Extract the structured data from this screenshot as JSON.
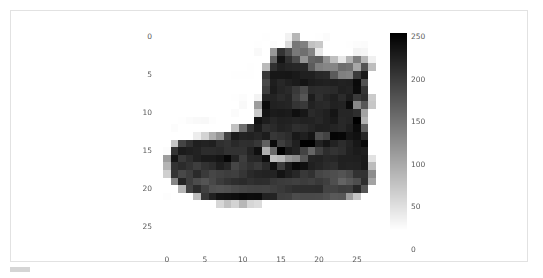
{
  "figure": {
    "background_color": "#ffffff",
    "border_color": "#e2e2e2",
    "corner_tab_color": "#d5d5d5"
  },
  "chart_data": {
    "type": "heatmap",
    "title": "",
    "xlabel": "",
    "ylabel": "",
    "colormap": "gray_r",
    "grid": false,
    "origin": "upper",
    "xlim": [
      -0.5,
      27.5
    ],
    "ylim": [
      27.5,
      -0.5
    ],
    "x_ticks": [
      "0",
      "5",
      "10",
      "15",
      "20",
      "25"
    ],
    "x_tick_values": [
      0,
      5,
      10,
      15,
      20,
      25
    ],
    "y_ticks": [
      "0",
      "5",
      "10",
      "15",
      "20",
      "25"
    ],
    "y_tick_values": [
      0,
      5,
      10,
      15,
      20,
      25
    ],
    "shape": [
      28,
      28
    ],
    "vmin": 0,
    "vmax": 255,
    "colorbar": {
      "orientation": "vertical",
      "position": "right",
      "ticks": [
        "250",
        "200",
        "150",
        "100",
        "50",
        "0"
      ],
      "tick_values": [
        250,
        200,
        150,
        100,
        50,
        0
      ],
      "range": [
        0,
        255
      ],
      "top_color": "#000000",
      "bottom_color": "#ffffff"
    },
    "values": [
      [
        0,
        0,
        0,
        0,
        0,
        0,
        0,
        0,
        0,
        0,
        0,
        0,
        0,
        1,
        0,
        0,
        13,
        73,
        0,
        0,
        1,
        4,
        0,
        0,
        0,
        0,
        0,
        0
      ],
      [
        0,
        0,
        0,
        0,
        0,
        0,
        0,
        0,
        0,
        0,
        0,
        0,
        1,
        0,
        3,
        0,
        36,
        136,
        127,
        62,
        54,
        0,
        0,
        0,
        1,
        3,
        4,
        0
      ],
      [
        0,
        0,
        0,
        0,
        0,
        0,
        0,
        0,
        0,
        0,
        0,
        0,
        6,
        0,
        102,
        204,
        176,
        134,
        144,
        123,
        23,
        0,
        0,
        0,
        0,
        12,
        10,
        0
      ],
      [
        0,
        0,
        0,
        0,
        0,
        0,
        0,
        0,
        0,
        0,
        0,
        0,
        0,
        0,
        155,
        236,
        207,
        178,
        107,
        156,
        161,
        109,
        64,
        23,
        77,
        130,
        72,
        15
      ],
      [
        0,
        0,
        0,
        0,
        0,
        0,
        0,
        0,
        0,
        0,
        0,
        1,
        0,
        69,
        207,
        223,
        218,
        216,
        216,
        163,
        127,
        121,
        122,
        146,
        141,
        88,
        172,
        66
      ],
      [
        0,
        0,
        0,
        0,
        0,
        0,
        0,
        0,
        0,
        1,
        1,
        1,
        0,
        200,
        232,
        232,
        233,
        229,
        223,
        223,
        215,
        213,
        164,
        127,
        123,
        196,
        229,
        0
      ],
      [
        0,
        0,
        0,
        0,
        0,
        0,
        0,
        0,
        0,
        0,
        0,
        0,
        0,
        183,
        225,
        216,
        223,
        228,
        235,
        227,
        224,
        222,
        224,
        221,
        223,
        245,
        173,
        0
      ],
      [
        0,
        0,
        0,
        0,
        0,
        0,
        0,
        0,
        0,
        0,
        0,
        0,
        0,
        193,
        228,
        218,
        213,
        198,
        180,
        212,
        210,
        211,
        213,
        223,
        220,
        243,
        202,
        0
      ],
      [
        0,
        0,
        0,
        0,
        0,
        0,
        0,
        0,
        0,
        1,
        3,
        0,
        12,
        219,
        220,
        212,
        218,
        192,
        169,
        227,
        208,
        218,
        224,
        212,
        226,
        197,
        209,
        52
      ],
      [
        0,
        0,
        0,
        0,
        0,
        0,
        0,
        0,
        0,
        0,
        6,
        0,
        99,
        244,
        222,
        220,
        218,
        203,
        198,
        221,
        215,
        213,
        222,
        220,
        245,
        119,
        167,
        56
      ],
      [
        0,
        0,
        0,
        0,
        0,
        0,
        0,
        0,
        0,
        4,
        0,
        0,
        55,
        236,
        228,
        230,
        228,
        240,
        232,
        213,
        218,
        223,
        234,
        217,
        217,
        209,
        92,
        0
      ],
      [
        0,
        0,
        1,
        4,
        6,
        7,
        2,
        0,
        0,
        0,
        0,
        0,
        237,
        226,
        217,
        223,
        222,
        219,
        222,
        221,
        216,
        223,
        229,
        215,
        218,
        255,
        77,
        0
      ],
      [
        0,
        3,
        0,
        0,
        0,
        0,
        0,
        0,
        0,
        62,
        145,
        204,
        228,
        207,
        213,
        221,
        218,
        208,
        211,
        218,
        224,
        223,
        219,
        215,
        224,
        244,
        159,
        0
      ],
      [
        0,
        0,
        0,
        0,
        18,
        44,
        82,
        107,
        189,
        228,
        220,
        222,
        217,
        226,
        200,
        205,
        211,
        230,
        224,
        234,
        176,
        188,
        250,
        248,
        233,
        238,
        215,
        0
      ],
      [
        0,
        57,
        187,
        208,
        224,
        221,
        224,
        208,
        204,
        214,
        208,
        209,
        200,
        159,
        245,
        193,
        206,
        223,
        255,
        255,
        221,
        234,
        221,
        211,
        220,
        232,
        246,
        0
      ],
      [
        3,
        202,
        228,
        224,
        221,
        211,
        211,
        214,
        205,
        205,
        205,
        220,
        240,
        80,
        150,
        255,
        229,
        221,
        188,
        154,
        191,
        210,
        204,
        209,
        222,
        228,
        225,
        0
      ],
      [
        98,
        233,
        198,
        210,
        222,
        229,
        229,
        234,
        249,
        220,
        194,
        215,
        217,
        241,
        65,
        73,
        106,
        117,
        168,
        219,
        221,
        215,
        217,
        223,
        223,
        224,
        229,
        29
      ],
      [
        75,
        204,
        212,
        204,
        193,
        205,
        211,
        225,
        216,
        185,
        197,
        206,
        198,
        213,
        240,
        195,
        227,
        245,
        239,
        223,
        218,
        212,
        209,
        222,
        220,
        221,
        230,
        67
      ],
      [
        48,
        203,
        183,
        194,
        213,
        197,
        185,
        190,
        194,
        192,
        202,
        214,
        219,
        221,
        220,
        236,
        225,
        216,
        199,
        206,
        186,
        181,
        177,
        172,
        181,
        205,
        206,
        115
      ],
      [
        0,
        122,
        219,
        193,
        179,
        171,
        183,
        196,
        204,
        210,
        213,
        207,
        211,
        210,
        200,
        196,
        194,
        191,
        195,
        191,
        198,
        192,
        176,
        156,
        167,
        177,
        210,
        92
      ],
      [
        0,
        0,
        74,
        189,
        212,
        191,
        175,
        172,
        175,
        181,
        185,
        188,
        189,
        188,
        193,
        198,
        204,
        209,
        210,
        210,
        211,
        188,
        188,
        194,
        192,
        216,
        170,
        0
      ],
      [
        2,
        0,
        0,
        0,
        66,
        200,
        222,
        237,
        239,
        242,
        246,
        243,
        244,
        221,
        220,
        193,
        191,
        179,
        182,
        182,
        181,
        176,
        166,
        168,
        99,
        58,
        0,
        0
      ],
      [
        0,
        0,
        0,
        0,
        0,
        0,
        0,
        40,
        61,
        44,
        72,
        41,
        35,
        0,
        0,
        0,
        0,
        0,
        0,
        0,
        0,
        0,
        0,
        0,
        0,
        0,
        0,
        0
      ],
      [
        0,
        0,
        0,
        0,
        0,
        0,
        0,
        0,
        0,
        0,
        0,
        0,
        0,
        0,
        0,
        0,
        0,
        0,
        0,
        0,
        0,
        0,
        0,
        0,
        0,
        0,
        0,
        0
      ],
      [
        0,
        0,
        0,
        0,
        0,
        0,
        0,
        0,
        0,
        0,
        0,
        0,
        0,
        0,
        0,
        0,
        0,
        0,
        0,
        0,
        0,
        0,
        0,
        0,
        0,
        0,
        0,
        0
      ],
      [
        0,
        0,
        0,
        0,
        0,
        0,
        0,
        0,
        0,
        0,
        0,
        0,
        0,
        0,
        0,
        0,
        0,
        0,
        0,
        0,
        0,
        0,
        0,
        0,
        0,
        0,
        0,
        0
      ],
      [
        0,
        0,
        0,
        0,
        0,
        0,
        0,
        0,
        0,
        0,
        0,
        0,
        0,
        0,
        0,
        0,
        0,
        0,
        0,
        0,
        0,
        0,
        0,
        0,
        0,
        0,
        0,
        0
      ],
      [
        0,
        0,
        0,
        0,
        0,
        0,
        0,
        0,
        0,
        0,
        0,
        0,
        0,
        0,
        0,
        0,
        0,
        0,
        0,
        0,
        0,
        0,
        0,
        0,
        0,
        0,
        0,
        0
      ]
    ]
  }
}
